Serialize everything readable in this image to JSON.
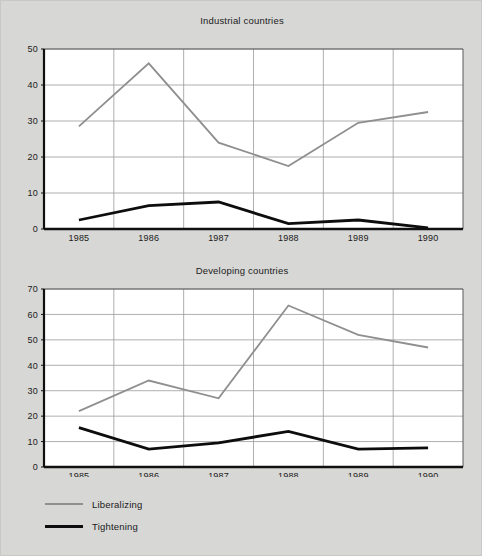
{
  "figure": {
    "background_color": "#d7d7d5",
    "plot_background_color": "#ffffff"
  },
  "legend": {
    "position": "bottom-left",
    "entries": [
      {
        "label": "Liberalizing",
        "color": "#8f8f8f",
        "icon": "line-swatch-gray"
      },
      {
        "label": "Tightening",
        "color": "#0d0d0d",
        "icon": "line-swatch-black"
      }
    ]
  },
  "chart_data": [
    {
      "type": "line",
      "title": "Industrial countries",
      "xlabel": "",
      "ylabel": "",
      "x": [
        "1985",
        "1986",
        "1987",
        "1988",
        "1989",
        "1990"
      ],
      "categories": [
        "1985",
        "1986",
        "1987",
        "1988",
        "1989",
        "1990"
      ],
      "ylim": [
        0,
        50
      ],
      "yticks": [
        0,
        10,
        20,
        30,
        40,
        50
      ],
      "ytick_labels": [
        "0",
        "10",
        "20",
        "30",
        "40",
        "50"
      ],
      "grid": true,
      "legend_position": "below-figure-left",
      "series": [
        {
          "name": "Liberalizing",
          "color": "#8f8f8f",
          "values": [
            28.5,
            46.0,
            24.0,
            17.5,
            29.5,
            32.5
          ]
        },
        {
          "name": "Tightening",
          "color": "#0d0d0d",
          "values": [
            2.5,
            6.5,
            7.5,
            1.5,
            2.5,
            0.3
          ]
        }
      ]
    },
    {
      "type": "line",
      "title": "Developing countries",
      "xlabel": "",
      "ylabel": "",
      "x": [
        "1985",
        "1986",
        "1987",
        "1988",
        "1989",
        "1990"
      ],
      "categories": [
        "1985",
        "1986",
        "1987",
        "1988",
        "1989",
        "1990"
      ],
      "ylim": [
        0,
        70
      ],
      "yticks": [
        0,
        10,
        20,
        30,
        40,
        50,
        60,
        70
      ],
      "ytick_labels": [
        "0",
        "10",
        "20",
        "30",
        "40",
        "50",
        "60",
        "70"
      ],
      "grid": true,
      "legend_position": "below-figure-left",
      "series": [
        {
          "name": "Liberalizing",
          "color": "#8f8f8f",
          "values": [
            22.0,
            34.0,
            27.0,
            63.5,
            52.0,
            47.0
          ]
        },
        {
          "name": "Tightening",
          "color": "#0d0d0d",
          "values": [
            15.5,
            7.0,
            9.5,
            14.0,
            7.0,
            7.5
          ]
        }
      ]
    }
  ]
}
